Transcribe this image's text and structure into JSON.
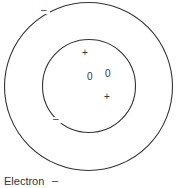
{
  "diagram": {
    "type": "atom-model",
    "outer_shell": {
      "cx": 88.5,
      "cy": 86.5,
      "r": 84,
      "stroke": "#333333"
    },
    "inner_shell": {
      "cx": 89,
      "cy": 86,
      "r": 46.5,
      "stroke": "#333333"
    },
    "particles": [
      {
        "symbol": "–",
        "kind": "electron",
        "x": 45,
        "y": 11
      },
      {
        "symbol": "–",
        "kind": "electron",
        "x": 57,
        "y": 120
      },
      {
        "symbol": "+",
        "kind": "proton",
        "x": 85,
        "y": 53
      },
      {
        "symbol": "+",
        "kind": "proton",
        "x": 107,
        "y": 97
      },
      {
        "symbol": "0",
        "kind": "neutron",
        "x": 90,
        "y": 77
      },
      {
        "symbol": "0",
        "kind": "neutron",
        "x": 108,
        "y": 74
      }
    ],
    "legend": {
      "label": "Electron",
      "symbol": "–"
    }
  }
}
